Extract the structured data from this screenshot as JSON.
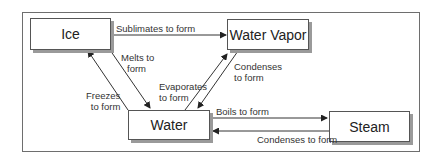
{
  "diagram": {
    "nodes": {
      "ice": "Ice",
      "water_vapor": "Water Vapor",
      "water": "Water",
      "steam": "Steam"
    },
    "edges": {
      "sublimates": "Sublimates to form",
      "melts_1": "Melts to",
      "melts_2": "form",
      "freezes_1": "Freezes",
      "freezes_2": "to form",
      "evaporates_1": "Evaporates",
      "evaporates_2": "to form",
      "condenses_vapor_1": "Condenses",
      "condenses_vapor_2": "to form",
      "boils": "Boils to form",
      "condenses_steam": "Condenses to form"
    },
    "colors": {
      "line": "#333333",
      "shadow": "#9a9a9a",
      "frame": "#6e6e6e"
    }
  }
}
